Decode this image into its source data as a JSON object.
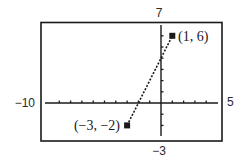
{
  "chart_data": {
    "type": "line",
    "title": "",
    "xlabel": "",
    "ylabel": "",
    "xlim": [
      -10,
      5
    ],
    "ylim": [
      -3,
      7
    ],
    "grid": false,
    "x_ticks_step": 1,
    "y_ticks_step": 1,
    "window_labels": {
      "xmin": "−10",
      "xmax": "5",
      "ymin": "−3",
      "ymax": "7"
    },
    "series": [
      {
        "name": "line segment",
        "style": "dotted",
        "x": [
          -3,
          1
        ],
        "y": [
          -2,
          6
        ],
        "markers": "square"
      }
    ],
    "annotations": [
      {
        "text": "(−3, −2)",
        "x": -3,
        "y": -2,
        "position": "left"
      },
      {
        "text": "(1, 6)",
        "x": 1,
        "y": 6,
        "position": "right"
      }
    ]
  },
  "colors": {
    "ink": "#1a1a1a",
    "background": "#ffffff"
  }
}
